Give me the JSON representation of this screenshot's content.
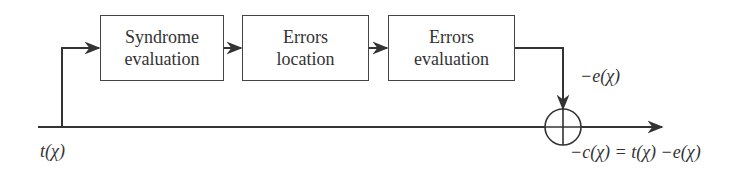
{
  "diagram": {
    "type": "block-diagram",
    "blocks": [
      {
        "id": "syndrome",
        "line1": "Syndrome",
        "line2": "evaluation"
      },
      {
        "id": "location",
        "line1": "Errors",
        "line2": "location"
      },
      {
        "id": "evaluation",
        "line1": "Errors",
        "line2": "evaluation"
      }
    ],
    "labels": {
      "input": "t(χ)",
      "error_signal": "−e(χ)",
      "output": "−c(χ) = t(χ) −e(χ)"
    },
    "summing_node": {
      "symbol": "⊕"
    },
    "colors": {
      "line": "#333333",
      "box_border": "#444444",
      "text": "#333333"
    }
  }
}
